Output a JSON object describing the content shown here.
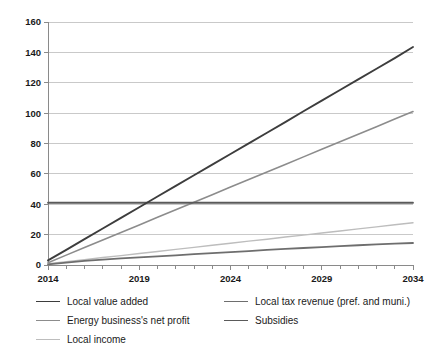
{
  "chart_data": {
    "type": "line",
    "title": "",
    "xlabel": "",
    "ylabel": "",
    "x": [
      2014,
      2015,
      2016,
      2017,
      2018,
      2019,
      2020,
      2021,
      2022,
      2023,
      2024,
      2025,
      2026,
      2027,
      2028,
      2029,
      2030,
      2031,
      2032,
      2033,
      2034
    ],
    "xlim": [
      2014,
      2034
    ],
    "ylim": [
      0,
      160
    ],
    "xticks": [
      2014,
      2019,
      2024,
      2029,
      2034
    ],
    "yticks": [
      0,
      20,
      40,
      60,
      80,
      100,
      120,
      140,
      160
    ],
    "ytick_labels": [
      "0",
      "20",
      "40",
      "60",
      "80",
      "100",
      "120",
      "140",
      "160"
    ],
    "xtick_labels": [
      "2014",
      "2019",
      "2024",
      "2029",
      "2034"
    ],
    "minor_xticks_every_years": 1,
    "grid": "horizontal",
    "legend_position": "bottom",
    "series": [
      {
        "name": "Local value added",
        "color": "#3d3d3d",
        "width": 1.9,
        "values": [
          3.0,
          10.0,
          17.0,
          24.0,
          31.0,
          38.0,
          45.1,
          52.1,
          59.1,
          66.1,
          73.1,
          80.1,
          87.1,
          94.1,
          101.2,
          108.2,
          115.2,
          122.2,
          129.2,
          136.2,
          143.5
        ]
      },
      {
        "name": "Energy business's net profit",
        "color": "#8c8c8c",
        "width": 1.6,
        "values": [
          1.5,
          6.5,
          11.5,
          16.5,
          21.4,
          26.4,
          31.4,
          36.4,
          41.3,
          46.3,
          51.3,
          56.3,
          61.2,
          66.2,
          71.2,
          76.2,
          81.1,
          86.1,
          91.1,
          96.1,
          101.0
        ]
      },
      {
        "name": "Local income",
        "color": "#bdbdbd",
        "width": 1.4,
        "values": [
          0.8,
          2.2,
          3.5,
          4.9,
          6.2,
          7.6,
          8.9,
          10.3,
          11.6,
          13.0,
          14.3,
          15.7,
          17.0,
          18.4,
          19.7,
          21.1,
          22.4,
          23.8,
          25.1,
          26.5,
          27.8
        ]
      },
      {
        "name": "Local tax revenue (pref. and muni.)",
        "color": "#6e6e6e",
        "width": 1.8,
        "values": [
          0.4,
          1.6,
          2.7,
          3.6,
          4.3,
          5.0,
          5.7,
          6.4,
          7.1,
          7.8,
          8.5,
          9.2,
          9.9,
          10.6,
          11.2,
          11.8,
          12.4,
          13.0,
          13.6,
          14.1,
          14.5
        ]
      },
      {
        "name": "Subsidies",
        "color": "#5a5a5a",
        "width": 1.8,
        "values": [
          41.0,
          41.0,
          41.0,
          41.0,
          41.0,
          41.0,
          41.0,
          41.0,
          41.0,
          41.0,
          41.0,
          41.0,
          41.0,
          41.0,
          41.0,
          41.0,
          41.0,
          41.0,
          41.0,
          41.0,
          41.0
        ]
      }
    ]
  },
  "legend": {
    "columns": [
      {
        "items": [
          {
            "label": "Local value added",
            "color": "#3d3d3d",
            "width": 1.9
          },
          {
            "label": "Energy business's net profit",
            "color": "#8c8c8c",
            "width": 1.6
          },
          {
            "label": "Local income",
            "color": "#bdbdbd",
            "width": 1.4
          }
        ]
      },
      {
        "items": [
          {
            "label": "Local tax revenue (pref. and muni.)",
            "color": "#6e6e6e",
            "width": 1.8
          },
          {
            "label": "Subsidies",
            "color": "#5a5a5a",
            "width": 1.8
          }
        ]
      }
    ]
  },
  "axes": {
    "grid_color": "#c9c9c9",
    "axis_color": "#8a8a8a"
  }
}
